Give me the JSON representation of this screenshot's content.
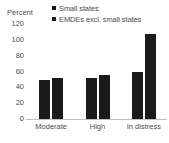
{
  "chart_data": {
    "type": "bar",
    "title": "",
    "subtitle": "",
    "xlabel": "",
    "ylabel": "Percent",
    "ylim": [
      0,
      120
    ],
    "yticks": [
      120,
      100,
      80,
      60,
      40,
      20,
      0
    ],
    "grid": false,
    "legend_position": "top-right",
    "categories": [
      "Moderate",
      "High",
      "In distress"
    ],
    "series": [
      {
        "name": "Small states",
        "color": "#1a1a1a",
        "values": [
          49,
          52,
          59
        ]
      },
      {
        "name": "EMDEs excl. small states",
        "color": "#1a1a1a",
        "values": [
          52,
          56,
          107
        ]
      }
    ]
  },
  "axis": {
    "percent_label": "Percent"
  },
  "colors": {
    "bar": "#1a1a1a",
    "axis_line": "#bfbfbf",
    "text": "#4d4d4d",
    "background": "#ffffff"
  }
}
